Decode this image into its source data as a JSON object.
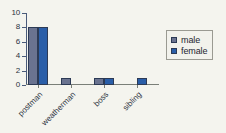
{
  "chart_data": {
    "type": "bar",
    "title": "",
    "subtitle": "",
    "xlabel": "",
    "ylabel": "",
    "categories": [
      "postman",
      "weatherman",
      "boss",
      "sibling"
    ],
    "series": [
      {
        "name": "male",
        "color": "#6a7390",
        "values": [
          8,
          1,
          1,
          0
        ]
      },
      {
        "name": "female",
        "color": "#2a5ea8",
        "values": [
          8,
          0,
          1,
          1
        ]
      }
    ],
    "ylim": [
      0,
      10
    ],
    "yticks": [
      0,
      2,
      4,
      6,
      8,
      10
    ],
    "ytick_labels": [
      "0",
      "2",
      "4",
      "6",
      "8",
      "10"
    ],
    "grid": false,
    "legend_position": "right",
    "legend_entries": [
      "male",
      "female"
    ],
    "xtick_label_rotation": -45
  },
  "colors": {
    "male": "#6a7390",
    "female": "#2a5ea8",
    "axis": "#4a5b7a",
    "background": "#f4f4ee",
    "text": "#2b3340"
  }
}
